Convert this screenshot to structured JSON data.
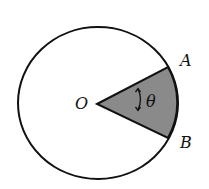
{
  "diagram": {
    "type": "circle-sector",
    "colors": {
      "stroke": "#111111",
      "sector_fill": "#8a8a8a",
      "background": "#ffffff"
    },
    "circle": {
      "center": [
        98,
        103
      ],
      "rx": 80,
      "ry": 76
    },
    "points": {
      "O": {
        "label": "O",
        "x": 97,
        "y": 104
      },
      "A": {
        "label": "A",
        "x": 168,
        "y": 67
      },
      "B": {
        "label": "B",
        "x": 168,
        "y": 138
      }
    },
    "angle": {
      "label": "θ",
      "between": [
        "OA",
        "OB"
      ],
      "marker": "double-arrow-arc"
    },
    "shaded_region": "sector OAB"
  }
}
